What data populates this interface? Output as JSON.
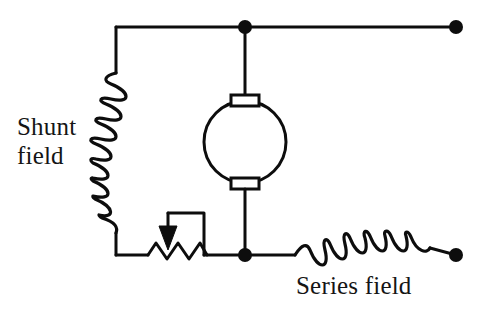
{
  "diagram": {
    "background_color": "#ffffff",
    "line_color": "#0d0d0d",
    "labels": {
      "shunt_field_line1": "Shunt",
      "shunt_field_line2": "field",
      "series_field": "Series field"
    },
    "components": [
      {
        "name": "shunt-field-coil",
        "type": "inductor",
        "orientation": "vertical",
        "loops": 9,
        "label": "Shunt field"
      },
      {
        "name": "armature",
        "type": "motor-armature",
        "shape": "circle",
        "brushes": 2
      },
      {
        "name": "field-rheostat",
        "type": "variable-resistor",
        "zigzag_peaks": 4,
        "has_arrow_tap": true
      },
      {
        "name": "series-field-coil",
        "type": "inductor",
        "orientation": "horizontal",
        "loops": 8,
        "label": "Series field"
      }
    ],
    "terminals": [
      {
        "name": "terminal-top-right",
        "x": 456,
        "y": 27
      },
      {
        "name": "terminal-bottom-right",
        "x": 456,
        "y": 255
      }
    ],
    "junctions": [
      {
        "name": "junction-top",
        "x": 245,
        "y": 27
      },
      {
        "name": "junction-bottom",
        "x": 245,
        "y": 255
      }
    ]
  }
}
